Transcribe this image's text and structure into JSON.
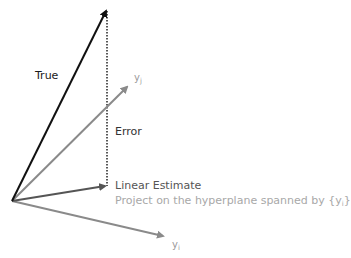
{
  "diagram": {
    "title": "",
    "labels": {
      "true_vector": "True",
      "error": "Error",
      "yj_base": "y",
      "yj_sub": "j",
      "yi_base": "y",
      "yi_sub": "i",
      "linear_estimate": "Linear Estimate",
      "projection_note_pre": "Project on the hyperplane spanned by {y",
      "projection_note_sub": "i",
      "projection_note_post": "}"
    },
    "colors": {
      "true_vector": "#111111",
      "estimate_vector": "#555555",
      "basis_vectors": "#8a8a8a",
      "error_line": "#222222"
    },
    "nodes": {
      "origin": [
        12,
        201
      ],
      "true_tip": [
        107,
        9
      ],
      "estimate_tip": [
        107,
        186
      ],
      "yj_tip": [
        128,
        86
      ],
      "yi_tip": [
        165,
        237
      ]
    }
  }
}
